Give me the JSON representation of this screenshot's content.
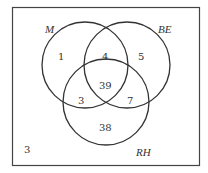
{
  "diagram": {
    "type": "venn",
    "sets": [
      {
        "name": "M",
        "label": "M"
      },
      {
        "name": "BE",
        "label": "BE"
      },
      {
        "name": "RH",
        "label": "RH"
      }
    ],
    "regions": {
      "M_only": "1",
      "M_BE": "4",
      "BE_only": "5",
      "M_BE_RH": "39",
      "M_RH": "3",
      "BE_RH": "7",
      "RH_only": "38",
      "outside": "3"
    },
    "colors": {
      "stroke": "#333333",
      "background": "#ffffff"
    }
  }
}
